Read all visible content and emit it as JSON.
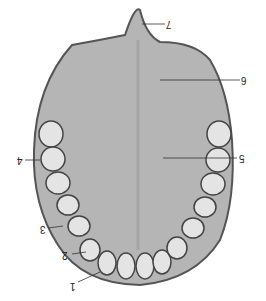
{
  "figure": {
    "labels": [
      {
        "id": "1",
        "text": "1"
      },
      {
        "id": "2",
        "text": "2"
      },
      {
        "id": "3",
        "text": "3"
      },
      {
        "id": "4",
        "text": "4"
      },
      {
        "id": "5",
        "text": "5"
      },
      {
        "id": "6",
        "text": "6"
      },
      {
        "id": "7",
        "text": "7"
      }
    ],
    "colors": {
      "palate": "#b9b9b9",
      "dark": "#5a5a5a",
      "tooth": "#e2e2e2",
      "background": "#ffffff"
    }
  }
}
